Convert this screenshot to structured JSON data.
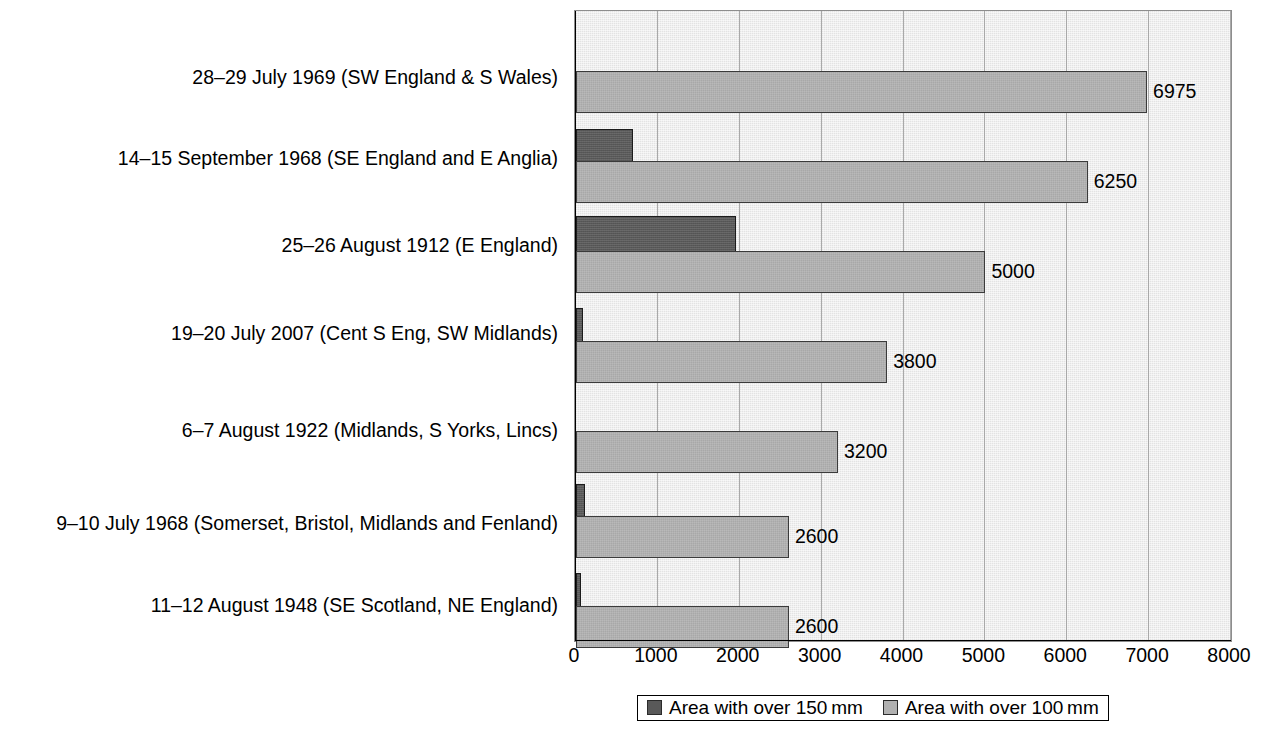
{
  "chart_data": {
    "type": "bar",
    "orientation": "horizontal",
    "title": "",
    "xlabel": "",
    "ylabel": "",
    "xlim": [
      0,
      8000
    ],
    "xticks": [
      0,
      1000,
      2000,
      3000,
      4000,
      5000,
      6000,
      7000,
      8000
    ],
    "xtick_labels": [
      "0",
      "1000",
      "2000",
      "3000",
      "4000",
      "5000",
      "6000",
      "7000",
      "8000"
    ],
    "grid": true,
    "grid_axis": "x",
    "legend_position": "bottom",
    "categories": [
      "28–29 July 1969 (SW England & S Wales)",
      "14–15 September 1968 (SE England and E Anglia)",
      "25–26 August 1912 (E England)",
      "19–20 July 2007 (Cent S Eng, SW Midlands)",
      "6–7 August 1922 (Midlands, S Yorks, Lincs)",
      "9–10 July 1968 (Somerset, Bristol, Midlands and Fenland)",
      "11–12 August 1948 (SE Scotland, NE England)"
    ],
    "series": [
      {
        "name": "Area with over 150 mm",
        "color": "#595959",
        "values": [
          0,
          700,
          1950,
          80,
          0,
          110,
          40
        ],
        "data_labels": [
          "",
          "",
          "",
          "",
          "",
          "",
          ""
        ]
      },
      {
        "name": "Area with over 100 mm",
        "color": "#b1b1b1",
        "values": [
          6975,
          6250,
          5000,
          3800,
          3200,
          2600,
          2600
        ],
        "data_labels": [
          "6975",
          "6250",
          "5000",
          "3800",
          "3200",
          "2600",
          "2600"
        ]
      }
    ]
  },
  "legend": {
    "items": [
      {
        "label": "Area with over 150 mm",
        "swatch": "dark"
      },
      {
        "label": "Area with over 100 mm",
        "swatch": "light"
      }
    ]
  },
  "colors": {
    "plot_background": "#e3e3e3",
    "gridline": "#a9a9a9",
    "axis": "#000000",
    "series_dark": "#595959",
    "series_light": "#b1b1b1"
  }
}
